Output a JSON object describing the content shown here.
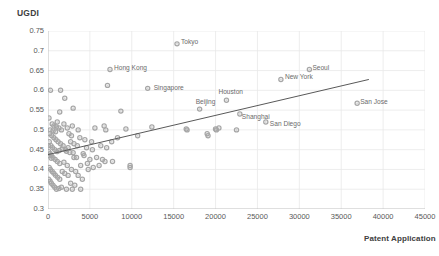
{
  "chart_data": {
    "type": "scatter",
    "title": "",
    "xlabel": "Patent Application",
    "ylabel": "UGDI",
    "xlim": [
      0,
      45000
    ],
    "ylim": [
      0.3,
      0.75
    ],
    "xticks": [
      0,
      5000,
      10000,
      15000,
      20000,
      25000,
      30000,
      35000,
      40000,
      45000
    ],
    "yticks": [
      0.3,
      0.35,
      0.4,
      0.45,
      0.5,
      0.55,
      0.6,
      0.65,
      0.7,
      0.75
    ],
    "grid": true,
    "legend": "none",
    "marker_color": "#a6a6a6",
    "trendline_color": "#595959",
    "gridline_color": "#e8e8e8",
    "trendline": {
      "x0": 0,
      "y0": 0.4375,
      "x1": 38300,
      "y1": 0.6275
    },
    "labeled_points": [
      {
        "name": "Tokyo",
        "x": 15400,
        "y": 0.7175,
        "label_dx": 4,
        "label_dy": -3
      },
      {
        "name": "Hong Kong",
        "x": 7400,
        "y": 0.6525,
        "label_dx": 4,
        "label_dy": -3
      },
      {
        "name": "Singapore",
        "x": 11900,
        "y": 0.605,
        "label_dx": 6,
        "label_dy": -1
      },
      {
        "name": "Houston",
        "x": 21300,
        "y": 0.575,
        "label_dx": -8,
        "label_dy": -9
      },
      {
        "name": "New York",
        "x": 27800,
        "y": 0.6275,
        "label_dx": 4,
        "label_dy": -3
      },
      {
        "name": "Seoul",
        "x": 31200,
        "y": 0.6525,
        "label_dx": 3,
        "label_dy": -3
      },
      {
        "name": "Beijing",
        "x": 18100,
        "y": 0.5525,
        "label_dx": -4,
        "label_dy": -8
      },
      {
        "name": "Shanghai",
        "x": 22900,
        "y": 0.54,
        "label_dx": 2,
        "label_dy": 2
      },
      {
        "name": "San Diego",
        "x": 26000,
        "y": 0.52,
        "label_dx": 4,
        "label_dy": 1
      },
      {
        "name": "San Jose",
        "x": 36900,
        "y": 0.5675,
        "label_dx": 3,
        "label_dy": -2
      }
    ],
    "points": [
      [
        15400,
        0.7175
      ],
      [
        7400,
        0.6525
      ],
      [
        11900,
        0.605
      ],
      [
        21300,
        0.575
      ],
      [
        27800,
        0.6275
      ],
      [
        31200,
        0.6525
      ],
      [
        18100,
        0.5525
      ],
      [
        22900,
        0.54
      ],
      [
        26000,
        0.52
      ],
      [
        36900,
        0.5675
      ],
      [
        300,
        0.6
      ],
      [
        1500,
        0.6
      ],
      [
        7100,
        0.6125
      ],
      [
        2000,
        0.58
      ],
      [
        1400,
        0.545
      ],
      [
        3000,
        0.555
      ],
      [
        8700,
        0.5475
      ],
      [
        1100,
        0.52
      ],
      [
        500,
        0.515
      ],
      [
        700,
        0.51
      ],
      [
        1000,
        0.5075
      ],
      [
        1300,
        0.505
      ],
      [
        250,
        0.5
      ],
      [
        600,
        0.4975
      ],
      [
        900,
        0.495
      ],
      [
        1600,
        0.5
      ],
      [
        2300,
        0.505
      ],
      [
        2900,
        0.51
      ],
      [
        3600,
        0.5
      ],
      [
        5600,
        0.505
      ],
      [
        6700,
        0.51
      ],
      [
        6900,
        0.5
      ],
      [
        9300,
        0.5025
      ],
      [
        12400,
        0.5075
      ],
      [
        16500,
        0.5025
      ],
      [
        19000,
        0.49
      ],
      [
        20000,
        0.5025
      ],
      [
        20400,
        0.505
      ],
      [
        22500,
        0.5
      ],
      [
        10700,
        0.485
      ],
      [
        8300,
        0.48
      ],
      [
        7600,
        0.47
      ],
      [
        7000,
        0.455
      ],
      [
        6300,
        0.46
      ],
      [
        5300,
        0.45
      ],
      [
        4600,
        0.455
      ],
      [
        4200,
        0.44
      ],
      [
        3500,
        0.46
      ],
      [
        3100,
        0.465
      ],
      [
        2700,
        0.47
      ],
      [
        2400,
        0.455
      ],
      [
        2100,
        0.45
      ],
      [
        1800,
        0.46
      ],
      [
        1500,
        0.465
      ],
      [
        1200,
        0.47
      ],
      [
        950,
        0.475
      ],
      [
        700,
        0.48
      ],
      [
        450,
        0.485
      ],
      [
        200,
        0.49
      ],
      [
        150,
        0.47
      ],
      [
        350,
        0.46
      ],
      [
        550,
        0.455
      ],
      [
        800,
        0.45
      ],
      [
        1050,
        0.445
      ],
      [
        1350,
        0.448
      ],
      [
        1700,
        0.452
      ],
      [
        2200,
        0.446
      ],
      [
        2600,
        0.443
      ],
      [
        3000,
        0.442
      ],
      [
        100,
        0.445
      ],
      [
        250,
        0.44
      ],
      [
        400,
        0.435
      ],
      [
        600,
        0.43
      ],
      [
        850,
        0.425
      ],
      [
        1100,
        0.42
      ],
      [
        1400,
        0.415
      ],
      [
        1900,
        0.418
      ],
      [
        2300,
        0.41
      ],
      [
        2800,
        0.4
      ],
      [
        3300,
        0.395
      ],
      [
        3900,
        0.41
      ],
      [
        4700,
        0.415
      ],
      [
        5400,
        0.405
      ],
      [
        6100,
        0.41
      ],
      [
        6800,
        0.42
      ],
      [
        7700,
        0.42
      ],
      [
        9800,
        0.405
      ],
      [
        9800,
        0.41
      ],
      [
        150,
        0.405
      ],
      [
        300,
        0.4
      ],
      [
        500,
        0.395
      ],
      [
        700,
        0.39
      ],
      [
        900,
        0.385
      ],
      [
        1150,
        0.38
      ],
      [
        1400,
        0.375
      ],
      [
        1700,
        0.395
      ],
      [
        2000,
        0.39
      ],
      [
        2400,
        0.385
      ],
      [
        2700,
        0.365
      ],
      [
        3200,
        0.36
      ],
      [
        3600,
        0.385
      ],
      [
        4100,
        0.375
      ],
      [
        100,
        0.375
      ],
      [
        250,
        0.37
      ],
      [
        400,
        0.365
      ],
      [
        600,
        0.36
      ],
      [
        800,
        0.355
      ],
      [
        1000,
        0.35
      ],
      [
        1300,
        0.352
      ],
      [
        1600,
        0.355
      ],
      [
        2200,
        0.35
      ],
      [
        2900,
        0.35
      ],
      [
        3900,
        0.35
      ],
      [
        4800,
        0.4
      ],
      [
        120,
        0.53
      ],
      [
        380,
        0.428
      ],
      [
        60,
        0.46
      ],
      [
        60,
        0.435
      ],
      [
        1900,
        0.515
      ],
      [
        2500,
        0.49
      ],
      [
        2800,
        0.485
      ],
      [
        3100,
        0.43
      ],
      [
        3400,
        0.43
      ],
      [
        4300,
        0.435
      ],
      [
        5000,
        0.425
      ],
      [
        5800,
        0.43
      ],
      [
        6500,
        0.425
      ],
      [
        5200,
        0.47
      ],
      [
        4400,
        0.475
      ],
      [
        3800,
        0.48
      ],
      [
        16600,
        0.5
      ],
      [
        19100,
        0.485
      ],
      [
        20100,
        0.5
      ]
    ]
  }
}
